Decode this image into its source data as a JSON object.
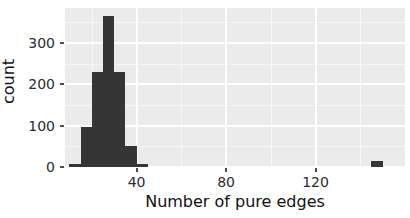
{
  "chart_data": {
    "type": "bar",
    "title": "",
    "subtitle": "",
    "xlabel": "Number of pure edges",
    "ylabel": "count",
    "xlim": [
      8,
      160
    ],
    "ylim": [
      0,
      385
    ],
    "xticks": [
      40,
      80,
      120
    ],
    "yticks": [
      0,
      100,
      200,
      300
    ],
    "xtick_labels": [
      "40",
      "80",
      "120"
    ],
    "ytick_labels": [
      "0",
      "100",
      "200",
      "300"
    ],
    "grid": true,
    "legend": "none",
    "binwidth": 5,
    "bins": [
      {
        "x_start": 10,
        "x_end": 15,
        "center": 12.5,
        "count": 8
      },
      {
        "x_start": 15,
        "x_end": 20,
        "center": 17.5,
        "count": 97
      },
      {
        "x_start": 20,
        "x_end": 25,
        "center": 22.5,
        "count": 231
      },
      {
        "x_start": 25,
        "x_end": 30,
        "center": 27.5,
        "count": 366
      },
      {
        "x_start": 30,
        "x_end": 35,
        "center": 32.5,
        "count": 230
      },
      {
        "x_start": 35,
        "x_end": 40,
        "center": 37.5,
        "count": 51
      },
      {
        "x_start": 40,
        "x_end": 45,
        "center": 42.5,
        "count": 7
      },
      {
        "x_start": 145,
        "x_end": 150,
        "center": 147.5,
        "count": 15
      }
    ],
    "categories": [
      "12.5",
      "17.5",
      "22.5",
      "27.5",
      "32.5",
      "37.5",
      "42.5",
      "147.5"
    ],
    "values": [
      8,
      97,
      231,
      366,
      230,
      51,
      7,
      15
    ],
    "annotations": [
      {
        "text": "isolated outlier bar near x = 147",
        "x": 147.5,
        "y": 15
      }
    ]
  },
  "style": {
    "panel_background": "#ebebeb",
    "gridline_color": "#ffffff",
    "bar_color": "#353535",
    "text_color": "#2b2b2b",
    "axis_title_color": "#111111"
  }
}
